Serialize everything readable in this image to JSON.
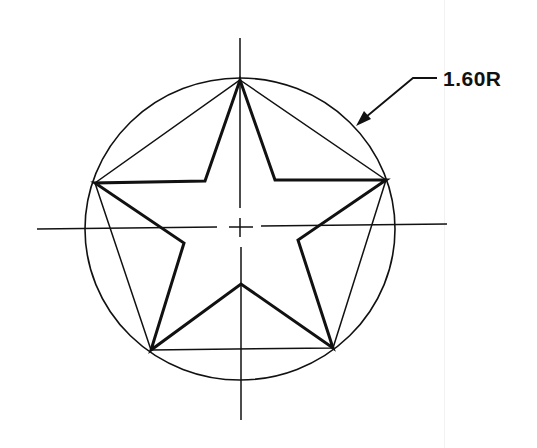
{
  "diagram": {
    "dimension_label": "1.60R",
    "colors": {
      "background": "#ffffff",
      "ink": "#111111"
    },
    "circle": {
      "cx": 240,
      "cy": 229,
      "rx": 155,
      "ry": 151
    },
    "star": {
      "outer_points": [
        [
          240,
          80
        ],
        [
          386,
          180
        ],
        [
          333,
          348
        ],
        [
          151,
          350
        ],
        [
          95,
          183
        ]
      ],
      "inner_points": [
        [
          275,
          180
        ],
        [
          298,
          240
        ],
        [
          241,
          284
        ],
        [
          184,
          243
        ],
        [
          205,
          181
        ]
      ]
    },
    "centerlines": {
      "vertical": {
        "x": 240,
        "y1": 38,
        "y2": 420
      },
      "horizontal": {
        "y": 227,
        "x1": 37,
        "x2": 447
      }
    },
    "leader": {
      "text_pos": [
        443,
        68
      ],
      "points": [
        [
          437,
          78
        ],
        [
          413,
          78
        ],
        [
          357,
          125
        ]
      ]
    }
  }
}
